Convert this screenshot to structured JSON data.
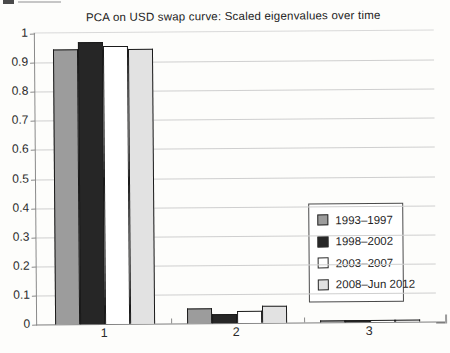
{
  "chart_data": {
    "type": "bar",
    "title": "PCA on USD swap curve: Scaled eigenvalues over time",
    "categories": [
      "1",
      "2",
      "3"
    ],
    "series": [
      {
        "name": "1993–1997",
        "color": "#9c9c9c",
        "values": [
          0.945,
          0.05,
          0.005
        ]
      },
      {
        "name": "1998–2002",
        "color": "#262626",
        "values": [
          0.97,
          0.03,
          0.006
        ]
      },
      {
        "name": "2003–2007",
        "color": "#ffffff",
        "values": [
          0.955,
          0.04,
          0.004
        ]
      },
      {
        "name": "2008–Jun 2012",
        "color": "#e2e2e2",
        "values": [
          0.945,
          0.06,
          0.005
        ]
      }
    ],
    "xlabel": "",
    "ylabel": "",
    "ylim": [
      0,
      1
    ],
    "yticks": [
      1,
      0.9,
      0.8,
      0.7,
      0.6,
      0.5,
      0.4,
      0.3,
      0.2,
      0.1,
      0
    ],
    "ytick_labels": [
      "1",
      "0.9",
      "0.8",
      "0.7",
      "0.6",
      "0.5",
      "0.4",
      "0.3",
      "0.2",
      "0.1",
      "0"
    ],
    "grid": "horizontal",
    "legend_position": "inside-right",
    "colors": {
      "bar_border": "#1a1a1a",
      "gridline": "#cfcfcf",
      "axis": "#8a8a8a",
      "text": "#2a2a2a",
      "background": "#fdfdfb"
    }
  }
}
